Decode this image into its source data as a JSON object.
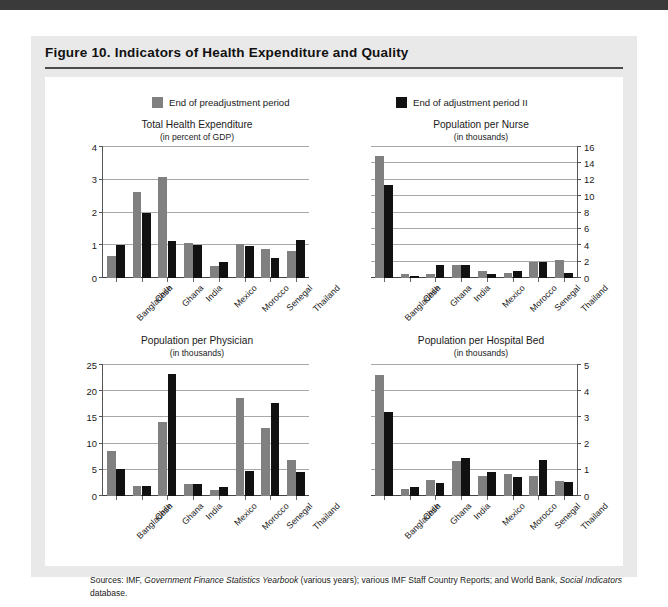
{
  "figure": {
    "title": "Figure 10.  Indicators of Health Expenditure and Quality",
    "source_prefix": "Sources: IMF, ",
    "source_italic_1": "Government Finance Statistics Yearbook",
    "source_mid": " (various years); various IMF Staff Country Reports; and World Bank, ",
    "source_italic_2": "Social Indicators",
    "source_suffix": " database."
  },
  "legend": {
    "items": [
      {
        "label": "End of preadjustment period",
        "color": "#808080"
      },
      {
        "label": "End of adjustment period II",
        "color": "#111111"
      }
    ]
  },
  "colors": {
    "series_a": "#808080",
    "series_b": "#111111",
    "panel_bg": "#e9e9e9",
    "plot_bg": "#ffffff",
    "gridline": "#a8a8a8",
    "top_strip": "#3a3a3a"
  },
  "chart_data": [
    {
      "type": "bar",
      "id": "total-health-expenditure",
      "title": "Total Health Expenditure",
      "subtitle": "(in percent of GDP)",
      "xlabel": "",
      "ylabel": "",
      "ylim": [
        0,
        4
      ],
      "yticks": [
        0,
        1,
        2,
        3,
        4
      ],
      "ytick_labels": [
        "0",
        "1",
        "2",
        "3",
        "4"
      ],
      "axis_side": "left",
      "grid": true,
      "legend_position": "top",
      "categories": [
        "Bangladesh",
        "Chile",
        "Ghana",
        "India",
        "Mexico",
        "Morocco",
        "Senegal",
        "Thailand"
      ],
      "series": [
        {
          "name": "End of preadjustment period",
          "color": "#808080",
          "values": [
            0.66,
            2.63,
            3.07,
            1.07,
            0.38,
            1.04,
            0.89,
            0.83
          ]
        },
        {
          "name": "End of adjustment period II",
          "color": "#111111",
          "values": [
            1.0,
            2.0,
            1.12,
            1.02,
            0.5,
            0.97,
            0.6,
            1.16
          ]
        }
      ]
    },
    {
      "type": "bar",
      "id": "population-per-nurse",
      "title": "Population per Nurse",
      "subtitle": "(in thousands)",
      "xlabel": "",
      "ylabel": "",
      "ylim": [
        0,
        16
      ],
      "yticks": [
        0,
        2,
        4,
        6,
        8,
        10,
        12,
        14,
        16
      ],
      "ytick_labels": [
        "0",
        "2",
        "4",
        "6",
        "8",
        "10",
        "12",
        "14",
        "16"
      ],
      "axis_side": "right",
      "grid": true,
      "legend_position": "top",
      "categories": [
        "Bangladesh",
        "Chile",
        "Ghana",
        "India",
        "Mexico",
        "Morocco",
        "Senegal",
        "Thailand"
      ],
      "series": [
        {
          "name": "End of preadjustment period",
          "color": "#808080",
          "values": [
            14.9,
            0.45,
            0.5,
            1.6,
            0.8,
            0.6,
            1.9,
            2.2
          ]
        },
        {
          "name": "End of adjustment period II",
          "color": "#111111",
          "values": [
            11.3,
            0.2,
            1.6,
            1.6,
            0.5,
            0.8,
            2.0,
            0.6
          ]
        }
      ]
    },
    {
      "type": "bar",
      "id": "population-per-physician",
      "title": "Population per Physician",
      "subtitle": "(in thousands)",
      "xlabel": "",
      "ylabel": "",
      "ylim": [
        0,
        25
      ],
      "yticks": [
        0,
        5,
        10,
        15,
        20,
        25
      ],
      "ytick_labels": [
        "0",
        "5",
        "10",
        "15",
        "20",
        "25"
      ],
      "axis_side": "left",
      "grid": true,
      "legend_position": "top",
      "categories": [
        "Bangladesh",
        "Chile",
        "Ghana",
        "India",
        "Mexico",
        "Morocco",
        "Senegal",
        "Thailand"
      ],
      "series": [
        {
          "name": "End of preadjustment period",
          "color": "#808080",
          "values": [
            8.6,
            2.0,
            14.2,
            2.3,
            1.1,
            18.7,
            13.0,
            6.8
          ]
        },
        {
          "name": "End of adjustment period II",
          "color": "#111111",
          "values": [
            5.2,
            1.9,
            23.3,
            2.3,
            1.7,
            4.8,
            17.7,
            4.5
          ]
        }
      ]
    },
    {
      "type": "bar",
      "id": "population-per-hospital-bed",
      "title": "Population per Hospital Bed",
      "subtitle": "(in thousands)",
      "xlabel": "",
      "ylabel": "",
      "ylim": [
        0,
        5
      ],
      "yticks": [
        0,
        1,
        2,
        3,
        4,
        5
      ],
      "ytick_labels": [
        "0",
        "1",
        "2",
        "3",
        "4",
        "5"
      ],
      "axis_side": "right",
      "grid": true,
      "legend_position": "top",
      "categories": [
        "Bangladesh",
        "Chile",
        "Ghana",
        "India",
        "Mexico",
        "Morocco",
        "Senegal",
        "Thailand"
      ],
      "series": [
        {
          "name": "End of preadjustment period",
          "color": "#808080",
          "values": [
            4.6,
            0.27,
            0.62,
            1.32,
            0.78,
            0.83,
            0.78,
            0.58
          ]
        },
        {
          "name": "End of adjustment period II",
          "color": "#111111",
          "values": [
            3.2,
            0.33,
            0.48,
            1.45,
            0.9,
            0.73,
            1.37,
            0.53
          ]
        }
      ]
    }
  ]
}
